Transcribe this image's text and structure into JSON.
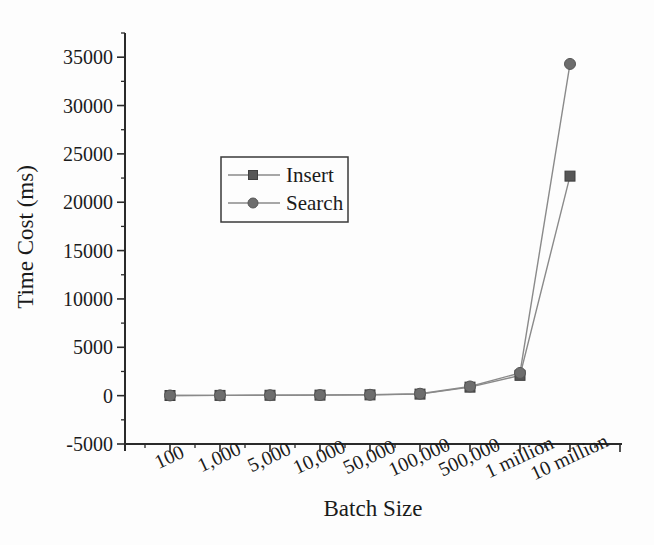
{
  "figure": {
    "background": "#fdfdfd",
    "axis_color": "#2a2a2a",
    "text_color": "#1b1b1b"
  },
  "chart_data": {
    "type": "line",
    "title": "",
    "xlabel": "Batch Size",
    "ylabel": "Time Cost (ms)",
    "categories": [
      "100",
      "1,000",
      "5,000",
      "10,000",
      "50,000",
      "100,000",
      "500,000",
      "1 million",
      "10 million"
    ],
    "series": [
      {
        "name": "Insert",
        "marker": "square",
        "marker_color": "#565656",
        "marker_edge": "#3f3f3f",
        "line_color": "#8a8a8a",
        "values": [
          15,
          25,
          40,
          55,
          80,
          160,
          880,
          2100,
          22700
        ]
      },
      {
        "name": "Search",
        "marker": "circle",
        "marker_color": "#6d6d6d",
        "marker_edge": "#565656",
        "line_color": "#8a8a8a",
        "values": [
          20,
          30,
          45,
          60,
          90,
          200,
          950,
          2350,
          34300
        ]
      }
    ],
    "ylim": [
      -5000,
      37500
    ],
    "ytick_step": 5000,
    "yminor_step": 2500,
    "ytick_labels": [
      "-5000",
      "0",
      "5000",
      "10000",
      "15000",
      "20000",
      "25000",
      "30000",
      "35000"
    ],
    "grid": false,
    "legend_position": "upper-left-inside"
  }
}
